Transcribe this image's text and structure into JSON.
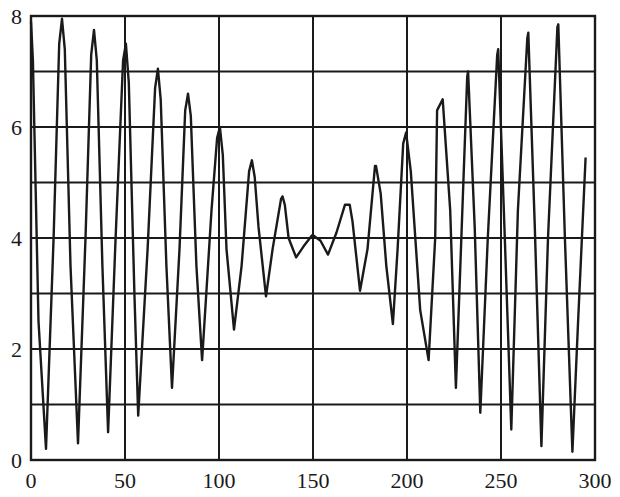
{
  "chart_data": {
    "type": "line",
    "title": "",
    "xlabel": "",
    "ylabel": "",
    "xlim": [
      0,
      300
    ],
    "ylim": [
      0,
      8
    ],
    "grid": true,
    "legend": null,
    "x_ticks": [
      0,
      50,
      100,
      150,
      200,
      250,
      300
    ],
    "x_tick_labels": [
      "0",
      "50",
      "100",
      "150",
      "200",
      "250",
      "300"
    ],
    "y_ticks": [
      0,
      2,
      4,
      6,
      8
    ],
    "y_tick_labels": [
      "0",
      "2",
      "4",
      "6",
      "8"
    ],
    "y_gridlines": [
      0,
      1,
      2,
      3,
      4,
      5,
      6,
      7,
      8
    ],
    "x_gridlines": [
      0,
      50,
      100,
      150,
      200,
      250,
      300
    ],
    "series": [
      {
        "name": "signal",
        "color": "#1a1a1a",
        "x": [
          0,
          1,
          4,
          8,
          12,
          15,
          16.5,
          18,
          21,
          25,
          29,
          32,
          33.5,
          35,
          38,
          41,
          45,
          49,
          50.5,
          52,
          55,
          57,
          62,
          66,
          67.5,
          69,
          72,
          75,
          79,
          82,
          83.5,
          85,
          88,
          91,
          96,
          99,
          100.5,
          102,
          104,
          108,
          112,
          116,
          117.5,
          119,
          121,
          125,
          128.5,
          133,
          133.8,
          135,
          137,
          141,
          145,
          149.5,
          150,
          154,
          158,
          162.5,
          167,
          169.5,
          171,
          175,
          179,
          183,
          183.5,
          186,
          189,
          192.5,
          195,
          198,
          199.5,
          202,
          207,
          211.5,
          215,
          216,
          219,
          223,
          226,
          232,
          232.5,
          236,
          239,
          243,
          248,
          248.5,
          252,
          255.5,
          259,
          264,
          264.5,
          268,
          271.5,
          275,
          280,
          280.5,
          284,
          288,
          291,
          295
        ],
        "y": [
          7.9,
          7.2,
          2.5,
          0.2,
          4.0,
          7.5,
          7.95,
          7.4,
          3.5,
          0.3,
          4.0,
          7.3,
          7.75,
          7.2,
          3.5,
          0.5,
          4.0,
          7.2,
          7.5,
          6.8,
          3.0,
          0.8,
          3.8,
          6.7,
          7.05,
          6.5,
          3.5,
          1.3,
          3.8,
          6.3,
          6.6,
          6.2,
          3.5,
          1.8,
          4.5,
          5.8,
          6.0,
          5.5,
          3.8,
          2.35,
          3.5,
          5.2,
          5.4,
          5.1,
          4.2,
          2.95,
          3.8,
          4.7,
          4.75,
          4.6,
          4.0,
          3.65,
          3.85,
          4.05,
          4.05,
          3.95,
          3.7,
          4.1,
          4.6,
          4.6,
          4.3,
          3.05,
          3.8,
          5.3,
          5.3,
          4.8,
          3.5,
          2.45,
          3.8,
          5.7,
          5.9,
          5.2,
          2.7,
          1.8,
          4.0,
          6.3,
          6.5,
          4.5,
          1.3,
          6.9,
          7.0,
          4.2,
          0.85,
          4.0,
          7.3,
          7.4,
          4.0,
          0.55,
          4.5,
          7.6,
          7.7,
          4.2,
          0.25,
          4.0,
          7.8,
          7.85,
          4.0,
          0.15,
          2.5,
          5.45
        ]
      }
    ]
  }
}
